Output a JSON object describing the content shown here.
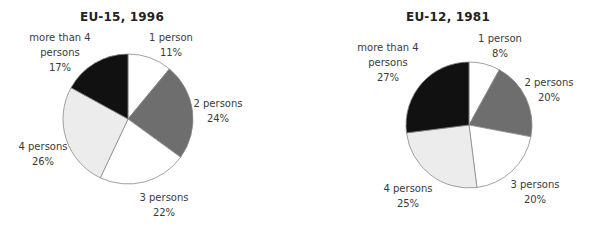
{
  "chart_data": [
    {
      "type": "pie",
      "title": "EU-15, 1996",
      "categories": [
        "1 person",
        "2 persons",
        "3 persons",
        "4 persons",
        "more than 4 persons"
      ],
      "values": [
        11,
        24,
        22,
        26,
        17
      ],
      "unit": "%",
      "colors": [
        "#ffffff",
        "#6e6e6e",
        "#ffffff",
        "#ececec",
        "#111111"
      ],
      "start_angle": "12 o'clock, clockwise",
      "legend": "none (direct labels)"
    },
    {
      "type": "pie",
      "title": "EU-12, 1981",
      "categories": [
        "1 person",
        "2 persons",
        "3 persons",
        "4 persons",
        "more than 4 persons"
      ],
      "values": [
        8,
        20,
        20,
        25,
        27
      ],
      "unit": "%",
      "colors": [
        "#ffffff",
        "#6e6e6e",
        "#ffffff",
        "#ececec",
        "#111111"
      ],
      "start_angle": "12 o'clock, clockwise",
      "legend": "none (direct labels)"
    }
  ],
  "left": {
    "title": "EU-15, 1996",
    "labels": {
      "p1": {
        "name": "1 person",
        "value": "11%"
      },
      "p2": {
        "name": "2 persons",
        "value": "24%"
      },
      "p3": {
        "name": "3 persons",
        "value": "22%"
      },
      "p4": {
        "name": "4 persons",
        "value": "26%"
      },
      "p5": {
        "name1": "more than 4",
        "name2": "persons",
        "value": "17%"
      }
    }
  },
  "right": {
    "title": "EU-12, 1981",
    "labels": {
      "p1": {
        "name": "1 person",
        "value": "8%"
      },
      "p2": {
        "name": "2 persons",
        "value": "20%"
      },
      "p3": {
        "name": "3 persons",
        "value": "20%"
      },
      "p4": {
        "name": "4 persons",
        "value": "25%"
      },
      "p5": {
        "name1": "more than 4",
        "name2": "persons",
        "value": "27%"
      }
    }
  }
}
